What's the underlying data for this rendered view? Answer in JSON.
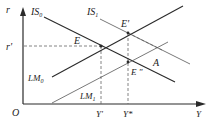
{
  "diagram": {
    "type": "IS-LM diagram",
    "axes": {
      "y_label": "r",
      "x_label": "Y",
      "origin_label": "O"
    },
    "curves": [
      {
        "id": "IS0",
        "label": "IS",
        "sub": "0",
        "style": "solid"
      },
      {
        "id": "IS1",
        "label": "IS",
        "sub": "1",
        "style": "solid-thin"
      },
      {
        "id": "LM0",
        "label": "LM",
        "sub": "0",
        "style": "solid"
      },
      {
        "id": "LM1",
        "label": "LM",
        "sub": "1",
        "style": "solid-thin"
      }
    ],
    "points": {
      "E": "E",
      "E_prime": "E'",
      "E_double": "E \"",
      "A": "A"
    },
    "levels": {
      "r_prime": "r'",
      "Y_prime": "Y'",
      "Y_star": "Y*"
    },
    "colors": {
      "line": "#2a2a2a",
      "thin_line": "#555555",
      "dashed": "#666666"
    }
  }
}
